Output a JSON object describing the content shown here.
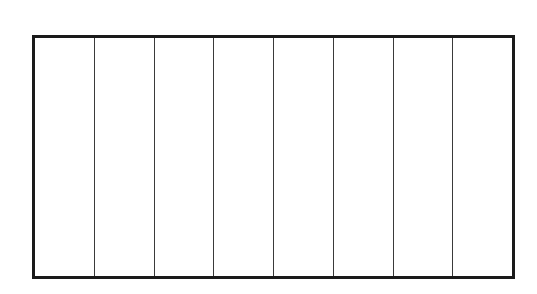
{
  "diagram": {
    "shape": "rectangle",
    "orientation": "horizontal",
    "equal_parts": 8,
    "parts": [
      {
        "index": 1,
        "label": ""
      },
      {
        "index": 2,
        "label": ""
      },
      {
        "index": 3,
        "label": ""
      },
      {
        "index": 4,
        "label": ""
      },
      {
        "index": 5,
        "label": ""
      },
      {
        "index": 6,
        "label": ""
      },
      {
        "index": 7,
        "label": ""
      },
      {
        "index": 8,
        "label": ""
      }
    ],
    "colors": {
      "outline": "#1a1a1a",
      "divider": "#3a3a3a",
      "fill": "#ffffff"
    }
  }
}
